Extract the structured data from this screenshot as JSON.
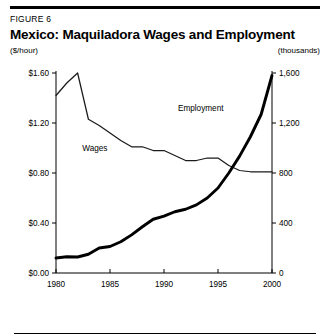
{
  "figure": {
    "label": "FIGURE 6",
    "title": "Mexico: Maquiladora Wages and Employment",
    "left_unit": "($/hour)",
    "right_unit": "(thousands)"
  },
  "colors": {
    "ink": "#000000",
    "background": "#ffffff",
    "wages_line": "#1a1a1a",
    "employment_line": "#000000"
  },
  "chart_data": {
    "type": "line",
    "title": "Mexico: Maquiladora Wages and Employment",
    "subtitle": "FIGURE 6",
    "xlabel": "",
    "ylabel": "($/hour)",
    "y2label": "(thousands)",
    "grid": false,
    "legend": "inline-annotations",
    "xlim": [
      1980,
      2000
    ],
    "ylim": [
      0.0,
      1.6
    ],
    "y2lim": [
      0,
      1600
    ],
    "xticks": [
      1980,
      1985,
      1990,
      1995,
      2000
    ],
    "xtick_labels": [
      "1980",
      "1985",
      "1990",
      "1995",
      "2000"
    ],
    "yticks": [
      0.0,
      0.4,
      0.8,
      1.2,
      1.6
    ],
    "ytick_labels": [
      "$0.00",
      "$0.40",
      "$0.80",
      "$1.20",
      "$1.60"
    ],
    "y2ticks": [
      0,
      400,
      800,
      1200,
      1600
    ],
    "y2tick_labels": [
      "0",
      "400",
      "800",
      "1,200",
      "1,600"
    ],
    "annotations": [
      {
        "text": "Wages",
        "x": 1983.6,
        "y": 0.98
      },
      {
        "text": "Employment",
        "x": 1993.4,
        "y": 1.3
      }
    ],
    "series": [
      {
        "name": "Wages",
        "axis": "left",
        "units": "$/hour",
        "x": [
          1980,
          1981,
          1982,
          1983,
          1984,
          1985,
          1986,
          1987,
          1988,
          1989,
          1990,
          1991,
          1992,
          1993,
          1994,
          1995,
          1996,
          1997,
          1998,
          1999,
          2000
        ],
        "values": [
          1.42,
          1.52,
          1.6,
          1.23,
          1.18,
          1.12,
          1.06,
          1.01,
          1.01,
          0.98,
          0.98,
          0.94,
          0.9,
          0.9,
          0.92,
          0.92,
          0.86,
          0.82,
          0.81,
          0.81,
          0.81
        ]
      },
      {
        "name": "Employment",
        "axis": "right",
        "units": "thousands",
        "x": [
          1980,
          1981,
          1982,
          1983,
          1984,
          1985,
          1986,
          1987,
          1988,
          1989,
          1990,
          1991,
          1992,
          1993,
          1994,
          1995,
          1996,
          1997,
          1998,
          1999,
          2000
        ],
        "values": [
          120,
          130,
          128,
          150,
          200,
          212,
          250,
          305,
          370,
          430,
          455,
          490,
          510,
          545,
          600,
          680,
          800,
          935,
          1090,
          1270,
          1580
        ]
      }
    ]
  }
}
